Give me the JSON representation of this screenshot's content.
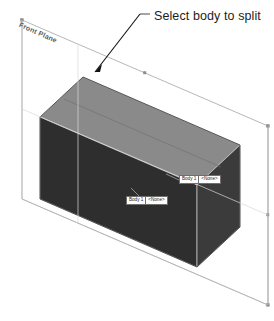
{
  "scene": {
    "title": "CAD viewport - split body selection",
    "background_color": "#ffffff"
  },
  "annotation": {
    "text": "Select body to split",
    "leader_color": "#000000"
  },
  "reference_plane": {
    "label": "Front Plane",
    "outline_color": "#9a9a9a",
    "handle_color": "#8a8a8a"
  },
  "body": {
    "top_face_color": "#858585",
    "left_face_color": "#2f2f2f",
    "front_face_color": "#3a3a3a",
    "edge_color": "#d8d8d8",
    "silhouette_color": "#1a1a1a"
  },
  "callouts": [
    {
      "id": "callout-1",
      "name": "Body 1",
      "value": "<None>"
    },
    {
      "id": "callout-2",
      "name": "Body 1",
      "value": "<None>"
    }
  ]
}
